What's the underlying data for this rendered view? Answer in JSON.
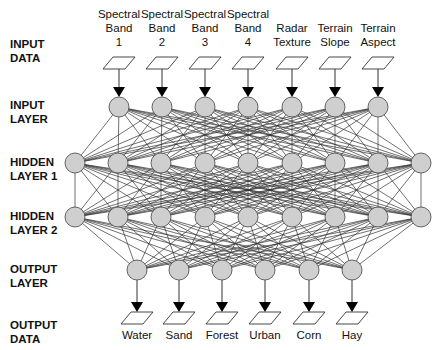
{
  "diagram": {
    "type": "neural-network",
    "row_labels": {
      "input_data": "INPUT\nDATA",
      "input_layer": "INPUT\nLAYER",
      "hidden_layer_1": "HIDDEN\nLAYER 1",
      "hidden_layer_2": "HIDDEN\nLAYER 2",
      "output_layer": "OUTPUT\nLAYER",
      "output_data": "OUTPUT\nDATA"
    },
    "inputs": [
      "Spectral\nBand\n1",
      "Spectral\nBand\n2",
      "Spectral\nBand\n3",
      "Spectral\nBand\n4",
      "Radar\nTexture",
      "Terrain\nSlope",
      "Terrain\nAspect"
    ],
    "outputs": [
      "Water",
      "Sand",
      "Forest",
      "Urban",
      "Corn",
      "Hay"
    ],
    "layers": {
      "input_nodes_x": [
        119,
        162,
        205,
        248,
        292,
        335,
        378
      ],
      "hidden_nodes_x": [
        75,
        118,
        161,
        205,
        248,
        292,
        335,
        378,
        421
      ],
      "output_nodes_x": [
        137,
        179,
        222,
        265,
        309,
        352
      ]
    },
    "colors": {
      "node_fill": "#cfcfcf",
      "stroke": "#333333",
      "text": "#111111"
    }
  }
}
